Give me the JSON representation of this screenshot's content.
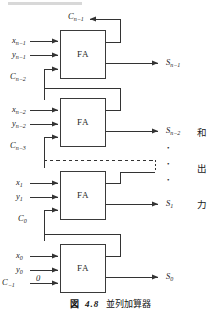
{
  "figure": {
    "caption": {
      "fig_word": "図",
      "number": "4.8",
      "title": "並列加算器"
    },
    "block_label": "FA",
    "side_label_chars": [
      "和",
      "出",
      "力"
    ],
    "ellipsis_dots": [
      "•",
      "•",
      "•"
    ],
    "stages": [
      {
        "id": "stage-n-1",
        "x_label": "x",
        "x_sub": "n−1",
        "y_label": "y",
        "y_sub": "n−1",
        "carry_in_label": "C",
        "carry_in_sub": "n−2",
        "carry_out_label": "C",
        "carry_out_sub": "n−1",
        "sum_label": "S",
        "sum_sub": "n−1",
        "block": "FA"
      },
      {
        "id": "stage-n-2",
        "x_label": "x",
        "x_sub": "n−2",
        "y_label": "y",
        "y_sub": "n−2",
        "carry_in_label": "C",
        "carry_in_sub": "n−3",
        "carry_out_label": "",
        "carry_out_sub": "",
        "sum_label": "S",
        "sum_sub": "n−2",
        "block": "FA"
      },
      {
        "id": "stage-1",
        "x_label": "x",
        "x_sub": "1",
        "y_label": "y",
        "y_sub": "1",
        "carry_in_label": "C",
        "carry_in_sub": "0",
        "carry_out_label": "",
        "carry_out_sub": "",
        "sum_label": "S",
        "sum_sub": "1",
        "block": "FA"
      },
      {
        "id": "stage-0",
        "x_label": "x",
        "x_sub": "0",
        "y_label": "y",
        "y_sub": "0",
        "carry_in_label": "C",
        "carry_in_sub": "−1",
        "carry_in_value": "0",
        "carry_out_label": "",
        "carry_out_sub": "",
        "sum_label": "S",
        "sum_sub": "0",
        "block": "FA"
      }
    ],
    "colors": {
      "line": "#333333",
      "box_stroke": "#3a3a3a",
      "box_fill": "#ffffff",
      "text": "#1a1a1a",
      "background": "#ffffff"
    }
  }
}
